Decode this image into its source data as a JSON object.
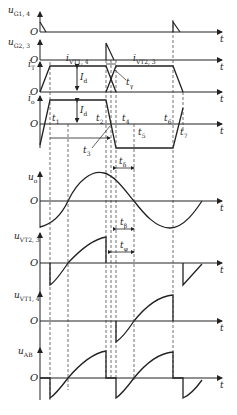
{
  "diagram": {
    "type": "waveform-timing-diagram",
    "axes": [
      {
        "id": "uG14",
        "label": "u",
        "sub": "G1, 4",
        "origin": "O",
        "time_label": "t"
      },
      {
        "id": "uG23",
        "label": "u",
        "sub": "G2, 3",
        "origin": "O",
        "time_label": "t"
      },
      {
        "id": "iT",
        "label": "i",
        "sub": "T",
        "origin": "O",
        "time_label": "t"
      },
      {
        "id": "io",
        "label": "i",
        "sub": "o",
        "origin": "O",
        "time_label": "t"
      },
      {
        "id": "uo",
        "label": "u",
        "sub": "o",
        "origin": "O",
        "time_label": "t"
      },
      {
        "id": "uVT23",
        "label": "u",
        "sub": "VT2, 3",
        "origin": "O",
        "time_label": "t"
      },
      {
        "id": "uVT14",
        "label": "u",
        "sub": "VT1, 4",
        "origin": "O",
        "time_label": "t"
      },
      {
        "id": "uAB",
        "label": "u",
        "sub": "AB",
        "origin": "O",
        "time_label": "t"
      }
    ],
    "annotations": {
      "iVT14": {
        "label": "i",
        "sub": "VT1, 4"
      },
      "iVT23": {
        "label": "i",
        "sub": "VT2, 3"
      },
      "Id1": {
        "label": "I",
        "sub": "d"
      },
      "Id2": {
        "label": "I",
        "sub": "d"
      },
      "tgamma": {
        "label": "t",
        "sub": "γ"
      },
      "t1a": {
        "label": "t",
        "sub": "1"
      },
      "t2": {
        "label": "t",
        "sub": "2"
      },
      "t3": {
        "label": "t",
        "sub": "3"
      },
      "t4": {
        "label": "t",
        "sub": "4"
      },
      "t5": {
        "label": "t",
        "sub": "5"
      },
      "t6": {
        "label": "t",
        "sub": "6"
      },
      "t7": {
        "label": "t",
        "sub": "7"
      },
      "tdelta": {
        "label": "t",
        "sub": "δ"
      },
      "tbeta": {
        "label": "t",
        "sub": "β"
      },
      "tphi": {
        "label": "t",
        "sub": "φ"
      }
    }
  }
}
